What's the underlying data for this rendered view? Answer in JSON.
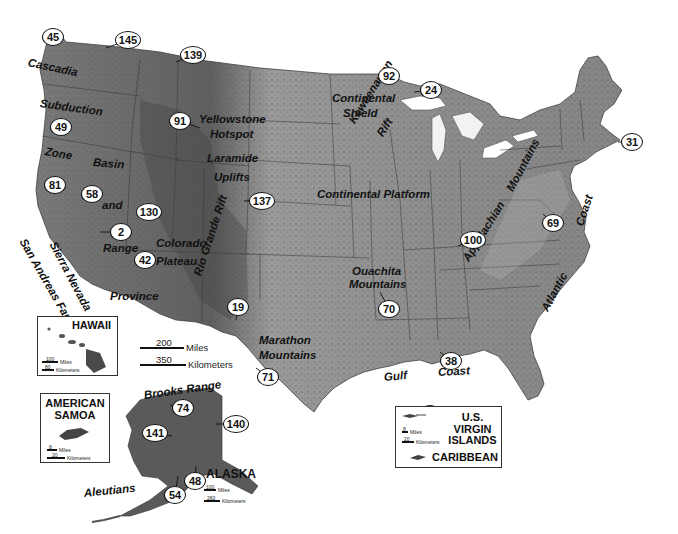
{
  "map": {
    "subject": "Physiographic map of the United States",
    "colors": {
      "land": "#8a8a8a",
      "land_dark": "#5e5e5e",
      "land_light": "#a8a8a8",
      "water": "#ffffff",
      "borders": "#333333"
    }
  },
  "region_labels": [
    {
      "id": "cascadia",
      "text": "Cascadia",
      "x": 28,
      "y": 57,
      "rotate": 12
    },
    {
      "id": "subduction",
      "text": "Subduction",
      "x": 40,
      "y": 98,
      "rotate": 8
    },
    {
      "id": "zone",
      "text": "Zone",
      "x": 45,
      "y": 146,
      "rotate": 10
    },
    {
      "id": "basin",
      "text": "Basin",
      "x": 93,
      "y": 157,
      "rotate": 5
    },
    {
      "id": "and",
      "text": "and",
      "x": 102,
      "y": 200,
      "rotate": 0
    },
    {
      "id": "range",
      "text": "Range",
      "x": 103,
      "y": 243,
      "rotate": 0
    },
    {
      "id": "province",
      "text": "Province",
      "x": 110,
      "y": 291,
      "rotate": 0
    },
    {
      "id": "sierra-nevada",
      "text": "Sierra Nevada",
      "x": 52,
      "y": 237,
      "rotate": 62
    },
    {
      "id": "san-andreas-fault",
      "text": "San Andreas Fault",
      "x": 22,
      "y": 234,
      "rotate": 60
    },
    {
      "id": "yellowstone",
      "text": "Yellowstone",
      "x": 199,
      "y": 114,
      "rotate": 0
    },
    {
      "id": "hotspot",
      "text": "Hotspot",
      "x": 210,
      "y": 129,
      "rotate": 0
    },
    {
      "id": "laramide",
      "text": "Laramide",
      "x": 207,
      "y": 153,
      "rotate": 0
    },
    {
      "id": "uplifts",
      "text": "Uplifts",
      "x": 214,
      "y": 172,
      "rotate": 0
    },
    {
      "id": "colorado",
      "text": "Colorado",
      "x": 156,
      "y": 238,
      "rotate": 0
    },
    {
      "id": "plateau",
      "text": "Plateau",
      "x": 156,
      "y": 256,
      "rotate": 0
    },
    {
      "id": "rio-grande-rift",
      "text": "Rio Grande Rift",
      "x": 198,
      "y": 270,
      "rotate": -72
    },
    {
      "id": "continental-shield-1",
      "text": "Continental",
      "x": 332,
      "y": 93,
      "rotate": 0
    },
    {
      "id": "continental-shield-2",
      "text": "Shield",
      "x": 343,
      "y": 108,
      "rotate": 0
    },
    {
      "id": "keweenawan",
      "text": "Keweenawan",
      "x": 352,
      "y": 117,
      "rotate": -58
    },
    {
      "id": "rift",
      "text": "Rift",
      "x": 380,
      "y": 130,
      "rotate": -58
    },
    {
      "id": "continental-platform",
      "text": "Continental Platform",
      "x": 317,
      "y": 189,
      "rotate": 0
    },
    {
      "id": "ouachita-1",
      "text": "Ouachita",
      "x": 352,
      "y": 266,
      "rotate": 0
    },
    {
      "id": "ouachita-2",
      "text": "Mountains",
      "x": 349,
      "y": 279,
      "rotate": 0
    },
    {
      "id": "appalachian",
      "text": "Appalachian",
      "x": 466,
      "y": 255,
      "rotate": -58
    },
    {
      "id": "mountains-app",
      "text": "Mountains",
      "x": 510,
      "y": 185,
      "rotate": -62
    },
    {
      "id": "atlantic",
      "text": "Atlantic",
      "x": 545,
      "y": 305,
      "rotate": -62
    },
    {
      "id": "coast-atl",
      "text": "Coast",
      "x": 580,
      "y": 220,
      "rotate": -72
    },
    {
      "id": "marathon-1",
      "text": "Marathon",
      "x": 259,
      "y": 335,
      "rotate": 0
    },
    {
      "id": "marathon-2",
      "text": "Mountains",
      "x": 259,
      "y": 350,
      "rotate": 0
    },
    {
      "id": "gulf",
      "text": "Gulf",
      "x": 384,
      "y": 372,
      "rotate": -5
    },
    {
      "id": "coast-gulf",
      "text": "Coast",
      "x": 438,
      "y": 367,
      "rotate": -3
    },
    {
      "id": "brooks-range",
      "text": "Brooks Range",
      "x": 144,
      "y": 390,
      "rotate": -8
    },
    {
      "id": "aleutians",
      "text": "Aleutians",
      "x": 84,
      "y": 488,
      "rotate": -6
    }
  ],
  "park_markers": [
    {
      "n": "45",
      "x": 53,
      "y": 37
    },
    {
      "n": "145",
      "x": 128,
      "y": 40
    },
    {
      "n": "139",
      "x": 193,
      "y": 55
    },
    {
      "n": "92",
      "x": 389,
      "y": 76
    },
    {
      "n": "24",
      "x": 431,
      "y": 90
    },
    {
      "n": "49",
      "x": 61,
      "y": 127
    },
    {
      "n": "91",
      "x": 180,
      "y": 121
    },
    {
      "n": "31",
      "x": 632,
      "y": 142
    },
    {
      "n": "81",
      "x": 55,
      "y": 185
    },
    {
      "n": "58",
      "x": 92,
      "y": 194
    },
    {
      "n": "137",
      "x": 262,
      "y": 201
    },
    {
      "n": "130",
      "x": 149,
      "y": 212
    },
    {
      "n": "69",
      "x": 553,
      "y": 223
    },
    {
      "n": "2",
      "x": 121,
      "y": 232
    },
    {
      "n": "100",
      "x": 473,
      "y": 240
    },
    {
      "n": "42",
      "x": 145,
      "y": 260
    },
    {
      "n": "19",
      "x": 238,
      "y": 307
    },
    {
      "n": "70",
      "x": 389,
      "y": 309
    },
    {
      "n": "86",
      "x": 88,
      "y": 344
    },
    {
      "n": "71",
      "x": 268,
      "y": 377
    },
    {
      "n": "38",
      "x": 451,
      "y": 361
    },
    {
      "n": "74",
      "x": 183,
      "y": 408
    },
    {
      "n": "140",
      "x": 236,
      "y": 424
    },
    {
      "n": "141",
      "x": 155,
      "y": 433
    },
    {
      "n": "48",
      "x": 195,
      "y": 481
    },
    {
      "n": "54",
      "x": 175,
      "y": 495
    },
    {
      "n": "84",
      "x": 430,
      "y": 414
    }
  ],
  "scale": {
    "miles_value": "200",
    "miles_unit": "Miles",
    "km_value": "350",
    "km_unit": "Kilometers"
  },
  "insets": {
    "hawaii": {
      "title": "HAWAII",
      "miles_value": "100",
      "miles_unit": "Miles",
      "km_value": "80",
      "km_unit": "Kilometers"
    },
    "american_samoa": {
      "title_line1": "AMERICAN",
      "title_line2": "SAMOA",
      "miles_value": "8",
      "miles_unit": "Miles",
      "km_value": "20",
      "km_unit": "Kilometers"
    },
    "alaska": {
      "title": "ALASKA",
      "miles_value": "100",
      "miles_unit": "Miles",
      "km_value": "260",
      "km_unit": "Kilometers"
    },
    "virgin_islands": {
      "title_line1": "U.S. VIRGIN",
      "title_line2": "ISLANDS",
      "subtitle": "CARIBBEAN",
      "miles_value": "8",
      "miles_unit": "Miles",
      "km_value": "20",
      "km_unit": "Kilometers"
    }
  }
}
